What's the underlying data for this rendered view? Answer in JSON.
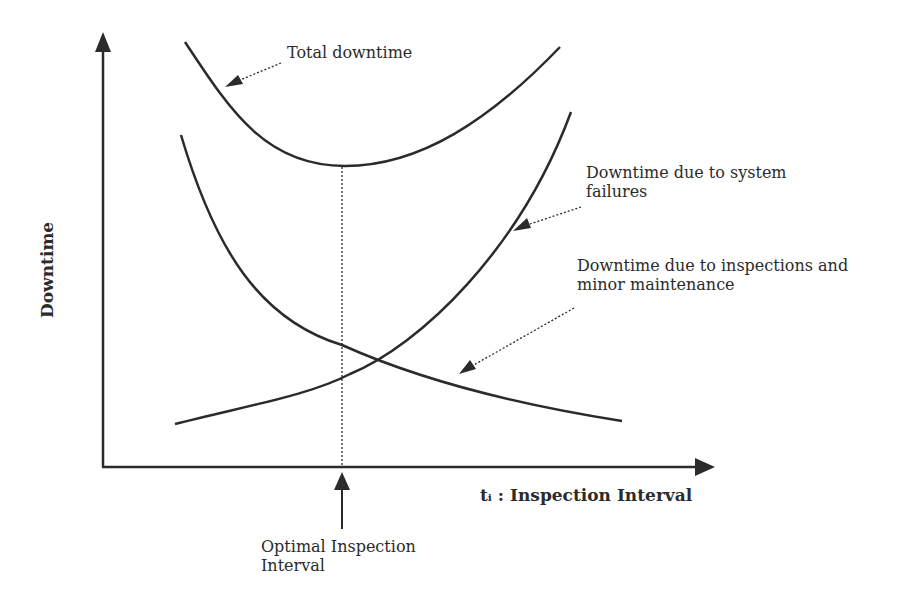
{
  "diagram": {
    "y_axis_label": "Downtime",
    "x_axis_label": "tᵢ : Inspection Interval",
    "curves": [
      {
        "id": "total",
        "label": "Total downtime",
        "shape": "U-shaped, minimum at optimal interval"
      },
      {
        "id": "failures",
        "label_line1": "Downtime due to system",
        "label_line2": "failures",
        "shape": "increasing with interval"
      },
      {
        "id": "inspections",
        "label_line1": "Downtime due to inspections and",
        "label_line2": "minor maintenance",
        "shape": "decreasing with interval"
      }
    ],
    "optimal_marker": {
      "label_line1": "Optimal Inspection",
      "label_line2": "Interval"
    },
    "colors": {
      "line": "#2b2b2b",
      "background": "#ffffff"
    }
  }
}
